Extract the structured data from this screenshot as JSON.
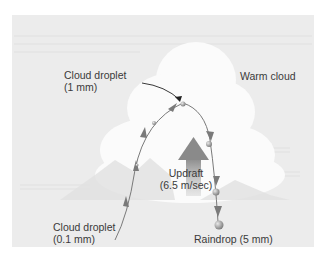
{
  "diagram": {
    "type": "process-diagram",
    "labels": {
      "cloud_type": "Warm cloud",
      "top_droplet_line1": "Cloud droplet",
      "top_droplet_line2": "(1 mm)",
      "start_droplet_line1": "Cloud droplet",
      "start_droplet_line2": "(0.1 mm)",
      "updraft_line1": "Updraft",
      "updraft_line2": "(6.5 m/sec)",
      "raindrop": "Raindrop (5 mm)"
    },
    "nodes": [
      {
        "id": "start",
        "label": "Cloud droplet (0.1 mm)"
      },
      {
        "id": "apex",
        "label": "Cloud droplet (1 mm)"
      },
      {
        "id": "end",
        "label": "Raindrop (5 mm)"
      }
    ],
    "edges": [
      {
        "from": "start",
        "to": "apex",
        "direction": "upward, carried by updraft"
      },
      {
        "from": "apex",
        "to": "end",
        "direction": "downward, falling as it grows"
      }
    ],
    "colors": {
      "panel_background": "#ececec",
      "cloud": "#fbfbfb",
      "path": "#7a7a7a",
      "updraft_arrow": "#8c8c8c",
      "text": "#3a3a3a"
    }
  }
}
